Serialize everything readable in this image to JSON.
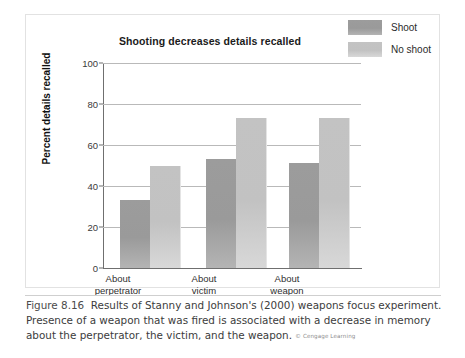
{
  "figure": {
    "number": "Figure 8.16",
    "caption": "Results of Stanny and Johnson's (2000) weapons focus experiment. Presence of a weapon that was fired is associated with a decrease in memory about the perpetrator, the victim, and the weapon.",
    "credit": "© Cengage Learning"
  },
  "legend": {
    "entries": [
      {
        "label": "Shoot",
        "color": "#9a9a9a"
      },
      {
        "label": "No shoot",
        "color": "#c2c2c2"
      }
    ]
  },
  "axis": {
    "y_ticks": [
      "0",
      "20",
      "40",
      "60",
      "80",
      "100"
    ],
    "y_title": "Percent details recalled"
  },
  "categories_multiline": [
    {
      "line1": "About",
      "line2": "perpetrator"
    },
    {
      "line1": "About",
      "line2": "victim"
    },
    {
      "line1": "About",
      "line2": "weapon"
    }
  ],
  "chart_data": {
    "type": "bar",
    "title": "Shooting decreases details recalled",
    "xlabel": "",
    "ylabel": "Percent details recalled",
    "ylim": [
      0,
      100
    ],
    "yticks": [
      0,
      20,
      40,
      60,
      80,
      100
    ],
    "grid": true,
    "legend_position": "right-outside",
    "categories": [
      "About perpetrator",
      "About victim",
      "About weapon"
    ],
    "series": [
      {
        "name": "Shoot",
        "color": "#9a9a9a",
        "values": [
          33,
          53,
          51
        ]
      },
      {
        "name": "No shoot",
        "color": "#c2c2c2",
        "values": [
          50,
          73,
          73
        ]
      }
    ]
  }
}
